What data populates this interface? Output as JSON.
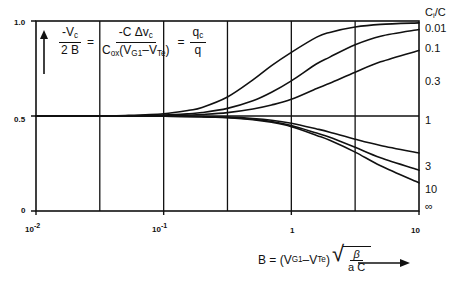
{
  "chart_data": {
    "type": "line",
    "title": "",
    "subtitle": "",
    "xlabel": "B = (V_G1 - V_Te) sqrt(beta / (a C))",
    "ylabel": "-V_c / 2B = -C dv_c / (C_ox (V_G1 - V_Te)) = q_c / q",
    "xscale": "log",
    "xlim": [
      0.01,
      10
    ],
    "ylim": [
      0,
      1
    ],
    "xticks": [
      0.01,
      0.1,
      1,
      10
    ],
    "xticklabels": [
      "10⁻²",
      "10⁻¹",
      "1",
      "10"
    ],
    "yticks": [
      0.5,
      1.0
    ],
    "yticklabels": [
      "0.5",
      "1.0"
    ],
    "origin_label": "0",
    "grid": "vertical half-decade gridlines",
    "legend_title": "Cᵢ /C",
    "legend_position": "right",
    "series": [
      {
        "name": "0.01",
        "label": "0.01",
        "x": [
          0.01,
          0.02,
          0.0316,
          0.05,
          0.1,
          0.158,
          0.2,
          0.316,
          0.5,
          0.7,
          1.0,
          1.58,
          2.0,
          3.16,
          5.0,
          10.0
        ],
        "y": [
          0.5,
          0.5,
          0.501,
          0.503,
          0.512,
          0.53,
          0.545,
          0.6,
          0.69,
          0.765,
          0.835,
          0.915,
          0.94,
          0.968,
          0.982,
          0.99
        ]
      },
      {
        "name": "0.1",
        "label": "0.1",
        "x": [
          0.01,
          0.02,
          0.0316,
          0.05,
          0.1,
          0.158,
          0.2,
          0.316,
          0.5,
          0.7,
          1.0,
          1.58,
          2.0,
          3.16,
          5.0,
          10.0
        ],
        "y": [
          0.5,
          0.5,
          0.5,
          0.501,
          0.505,
          0.512,
          0.518,
          0.54,
          0.58,
          0.625,
          0.685,
          0.775,
          0.81,
          0.875,
          0.92,
          0.955
        ]
      },
      {
        "name": "0.3",
        "label": "0.3",
        "x": [
          0.01,
          0.02,
          0.0316,
          0.05,
          0.1,
          0.158,
          0.2,
          0.316,
          0.5,
          0.7,
          1.0,
          1.58,
          2.0,
          3.16,
          5.0,
          10.0
        ],
        "y": [
          0.5,
          0.5,
          0.5,
          0.5,
          0.502,
          0.505,
          0.508,
          0.518,
          0.537,
          0.558,
          0.588,
          0.645,
          0.672,
          0.73,
          0.785,
          0.845
        ]
      },
      {
        "name": "1",
        "label": "1",
        "x": [
          0.01,
          0.1,
          0.316,
          1.0,
          3.16,
          10.0
        ],
        "y": [
          0.5,
          0.5,
          0.5,
          0.5,
          0.5,
          0.5
        ]
      },
      {
        "name": "3",
        "label": "3",
        "x": [
          0.01,
          0.0316,
          0.1,
          0.2,
          0.316,
          0.5,
          0.7,
          1.0,
          1.58,
          2.0,
          3.16,
          5.0,
          10.0
        ],
        "y": [
          0.5,
          0.5,
          0.499,
          0.497,
          0.494,
          0.487,
          0.478,
          0.462,
          0.432,
          0.415,
          0.378,
          0.345,
          0.305
        ]
      },
      {
        "name": "10",
        "label": "10",
        "x": [
          0.01,
          0.0316,
          0.1,
          0.2,
          0.316,
          0.5,
          0.7,
          1.0,
          1.58,
          2.0,
          3.16,
          5.0,
          10.0
        ],
        "y": [
          0.5,
          0.5,
          0.499,
          0.496,
          0.492,
          0.483,
          0.471,
          0.45,
          0.41,
          0.388,
          0.335,
          0.28,
          0.215
        ]
      },
      {
        "name": "inf",
        "label": "∞",
        "x": [
          0.01,
          0.0316,
          0.1,
          0.2,
          0.316,
          0.5,
          0.7,
          1.0,
          1.58,
          2.0,
          3.16,
          5.0,
          10.0
        ],
        "y": [
          0.5,
          0.5,
          0.499,
          0.496,
          0.491,
          0.481,
          0.467,
          0.444,
          0.398,
          0.372,
          0.31,
          0.238,
          0.148
        ]
      }
    ]
  },
  "axes": {
    "y_top_label": "1.0",
    "y_mid_label": "0.5",
    "origin_label": "0",
    "x_labels": [
      {
        "base": "10",
        "exp": "-2"
      },
      {
        "base": "10",
        "exp": "-1"
      },
      {
        "base": "1",
        "exp": ""
      },
      {
        "base": "10",
        "exp": ""
      }
    ]
  },
  "legend": {
    "title_c": "C",
    "title_sub": "i",
    "title_rest": "/C",
    "items": [
      "0.01",
      "0.1",
      "0.3",
      "1",
      "3",
      "10",
      "∞"
    ]
  },
  "formula_y": {
    "num1": "-V",
    "num1_sub": "c",
    "den1": "2 B",
    "eq1": "=",
    "num2_a": "-C",
    "num2_b": "Δv",
    "num2_sub": "c",
    "den2_a": "C",
    "den2_sub": "ox",
    "den2_b": "(V",
    "den2_sub2": "G1",
    "den2_c": "–V",
    "den2_sub3": "Te",
    "den2_d": ")",
    "eq2": "=",
    "num3": "q",
    "num3_sub": "c",
    "den3": "q"
  },
  "formula_x": {
    "lead": "B =",
    "paren_open": "(",
    "v1": "V",
    "v1_sub": "G1",
    "minus": "–V",
    "v2_sub": "Te",
    "paren_close": ")",
    "radical": "√",
    "rad_num": "β",
    "rad_den": "a C"
  },
  "colors": {
    "line": "#111111",
    "background": "#ffffff",
    "text": "#111111"
  }
}
